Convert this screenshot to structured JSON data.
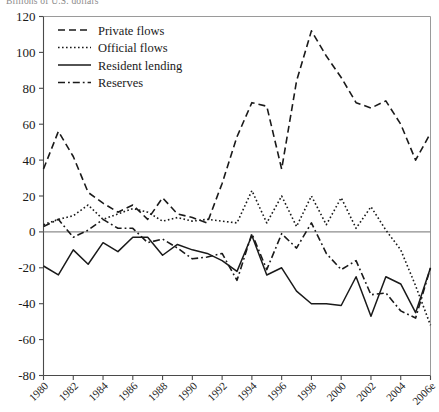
{
  "figure": {
    "unit_note": "Billions of U.S. dollars"
  },
  "chart_data": {
    "type": "line",
    "title": "",
    "subtitle": "",
    "xlabel": "",
    "ylabel": "",
    "unit_note": "Billions of U.S. dollars",
    "grid": false,
    "zero_line": true,
    "legend_position": "top-left",
    "xlim": [
      1980,
      2006
    ],
    "ylim": [
      -80,
      120
    ],
    "ytick_labels": [
      "120",
      "100",
      "80",
      "60",
      "40",
      "20",
      "0",
      "-20",
      "-40",
      "-60",
      "-80"
    ],
    "yticks": [
      120,
      100,
      80,
      60,
      40,
      20,
      0,
      -20,
      -40,
      -60,
      -80
    ],
    "xtick_labels": [
      "1980",
      "1982",
      "1984",
      "1986",
      "1988",
      "1990",
      "1992",
      "1994",
      "1996",
      "1998",
      "2000",
      "2002",
      "2004",
      "2006e"
    ],
    "xticks": [
      1980,
      1982,
      1984,
      1986,
      1988,
      1990,
      1992,
      1994,
      1996,
      1998,
      2000,
      2002,
      2004,
      2006
    ],
    "x": [
      1980,
      1981,
      1982,
      1983,
      1984,
      1985,
      1986,
      1987,
      1988,
      1989,
      1990,
      1991,
      1992,
      1993,
      1994,
      1995,
      1996,
      1997,
      1998,
      1999,
      2000,
      2001,
      2002,
      2003,
      2004,
      2005,
      2006
    ],
    "series": [
      {
        "name": "Private flows",
        "style": "dashed",
        "color": "#1a1a1a",
        "values": [
          35,
          56,
          42,
          22,
          16,
          11,
          15,
          7,
          19,
          10,
          8,
          5,
          27,
          53,
          72,
          70,
          35,
          84,
          112,
          98,
          86,
          72,
          69,
          73,
          60,
          40,
          55
        ]
      },
      {
        "name": "Official flows",
        "style": "dotted",
        "color": "#1a1a1a",
        "values": [
          4,
          7,
          9,
          15,
          7,
          10,
          13,
          11,
          6,
          8,
          6,
          7,
          6,
          5,
          23,
          5,
          20,
          3,
          20,
          4,
          19,
          2,
          14,
          1,
          -10,
          -30,
          -52
        ]
      },
      {
        "name": "Resident lending",
        "style": "solid",
        "color": "#1a1a1a",
        "values": [
          -19,
          -24,
          -10,
          -18,
          -6,
          -11,
          -3,
          -3,
          -13,
          -7,
          -10,
          -12,
          -16,
          -22,
          -2,
          -24,
          -20,
          -33,
          -40,
          -40,
          -41,
          -25,
          -47,
          -25,
          -29,
          -45,
          -20
        ]
      },
      {
        "name": "Reserves",
        "style": "dashdot",
        "color": "#1a1a1a",
        "values": [
          3,
          7,
          -3,
          1,
          7,
          2,
          2,
          -6,
          -4,
          -9,
          -15,
          -14,
          -12,
          -27,
          -1,
          -21,
          -1,
          -9,
          5,
          -12,
          -21,
          -16,
          -35,
          -34,
          -44,
          -48,
          -20
        ]
      }
    ]
  }
}
